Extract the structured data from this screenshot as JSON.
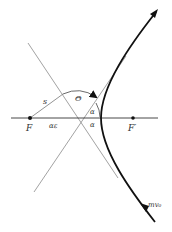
{
  "diagram": {
    "type": "hyperbolic-scattering-orbit",
    "labels": {
      "focus": "F",
      "other_focus": "F′",
      "impact_line": "s",
      "center_distance": "αε",
      "deflection_angle": "Θ",
      "asymptote_angle_upper": "α",
      "asymptote_angle_lower": "α",
      "incoming_momentum": "mv₀"
    },
    "colors": {
      "curve": "#111111",
      "thin_lines": "#8a8a8a",
      "axis": "#333333"
    }
  }
}
